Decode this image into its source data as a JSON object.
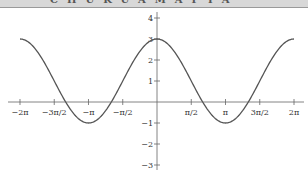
{
  "chart_data": {
    "type": "line",
    "title": "",
    "function": "y = 2cos(x) + 1",
    "xlabel": "",
    "ylabel": "",
    "xlim": [
      -6.2832,
      6.2832
    ],
    "ylim": [
      -3,
      4
    ],
    "grid": false,
    "legend": null,
    "x_tick_labels": [
      "−2π",
      "−3π/2",
      "−π",
      "−π/2",
      "π/2",
      "π",
      "3π/2",
      "2π"
    ],
    "x_tick_values": [
      -6.2832,
      -4.7124,
      -3.1416,
      -1.5708,
      1.5708,
      3.1416,
      4.7124,
      6.2832
    ],
    "y_tick_labels": [
      "4",
      "3",
      "2",
      "1",
      "−1",
      "−2",
      "−3"
    ],
    "y_tick_values": [
      4,
      3,
      2,
      1,
      -1,
      -2,
      -3
    ],
    "series": [
      {
        "name": "y = 2cos(x) + 1",
        "color": "#555555",
        "x": [
          -6.2832,
          -4.7124,
          -3.1416,
          -2.0944,
          -1.5708,
          0,
          1.5708,
          2.0944,
          3.1416,
          4.7124,
          6.2832
        ],
        "y": [
          3,
          1,
          -1,
          0,
          1,
          3,
          1,
          0,
          -1,
          1,
          3
        ]
      }
    ]
  },
  "banner": {
    "text": "CHUKUAMAPIA"
  }
}
